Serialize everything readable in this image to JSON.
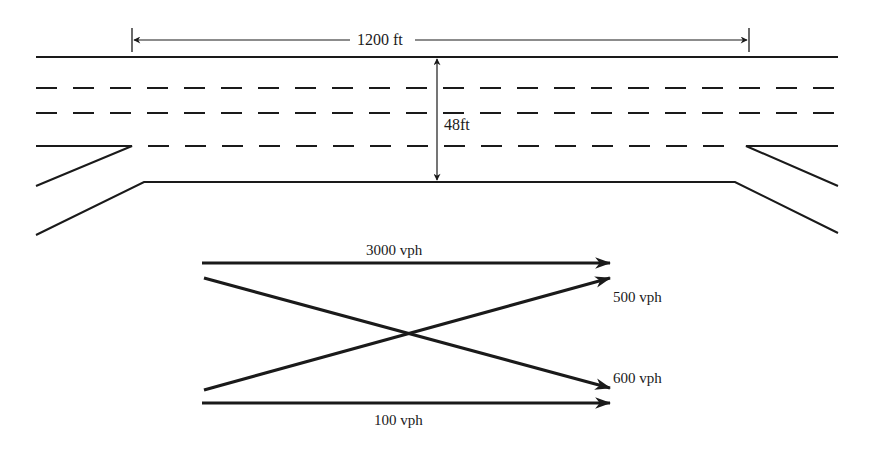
{
  "diagram": {
    "type": "freeway weaving section",
    "dimensions": {
      "length_label": "1200 ft",
      "width_label": "48ft"
    },
    "lanes": {
      "mainline_lanes": 4,
      "lane_line_style": "dashed",
      "on_ramp": "left (upstream)",
      "off_ramp": "right (downstream)"
    },
    "flows": [
      {
        "label": "3000 vph",
        "movement": "freeway-to-freeway",
        "direction": "straight"
      },
      {
        "label": "500 vph",
        "movement": "ramp-to-freeway",
        "direction": "diagonal up"
      },
      {
        "label": "600 vph",
        "movement": "freeway-to-ramp",
        "direction": "diagonal down"
      },
      {
        "label": "100 vph",
        "movement": "ramp-to-ramp",
        "direction": "straight"
      }
    ]
  },
  "colors": {
    "line": "#1a1a1a",
    "background": "#ffffff"
  }
}
